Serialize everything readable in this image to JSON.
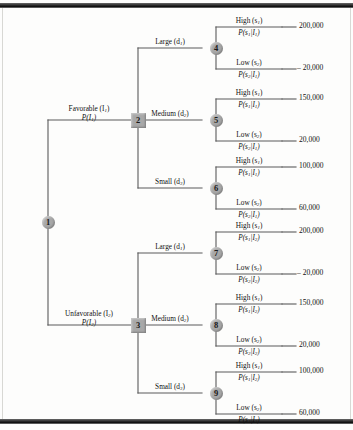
{
  "figure": {
    "type": "decision-tree",
    "node_shapes": {
      "chance": "circle",
      "decision": "square"
    },
    "node_fill": "#a8a8a8",
    "line_color": "#5a5a5a"
  },
  "nodes": [
    {
      "id": "1",
      "label": "1",
      "kind": "chance"
    },
    {
      "id": "2",
      "label": "2",
      "kind": "decision"
    },
    {
      "id": "3",
      "label": "3",
      "kind": "decision"
    },
    {
      "id": "4",
      "label": "4",
      "kind": "chance"
    },
    {
      "id": "5",
      "label": "5",
      "kind": "chance"
    },
    {
      "id": "6",
      "label": "6",
      "kind": "chance"
    },
    {
      "id": "7",
      "label": "7",
      "kind": "chance"
    },
    {
      "id": "8",
      "label": "8",
      "kind": "chance"
    },
    {
      "id": "9",
      "label": "9",
      "kind": "chance"
    }
  ],
  "information_branches": [
    {
      "name": "favorable",
      "label": "Favorable (I",
      "label_sub": "1",
      "label_tail": ")",
      "prob": "P(I",
      "prob_sub": "1",
      "prob_tail": ")"
    },
    {
      "name": "unfavorable",
      "label": "Unfavorable (I",
      "label_sub": "2",
      "label_tail": ")",
      "prob": "P(I",
      "prob_sub": "2",
      "prob_tail": ")"
    }
  ],
  "decisions": [
    {
      "name": "large",
      "label": "Large (d",
      "sub": "1",
      "tail": ")"
    },
    {
      "name": "medium",
      "label": "Medium (d",
      "sub": "2",
      "tail": ")"
    },
    {
      "name": "small",
      "label": "Small (d",
      "sub": "3",
      "tail": ")"
    }
  ],
  "states": [
    {
      "name": "high",
      "label": "High (s",
      "sub": "1",
      "tail": ")"
    },
    {
      "name": "low",
      "label": "Low (s",
      "sub": "2",
      "tail": ")"
    }
  ],
  "branches": {
    "n4": {
      "high": {
        "state": "High (s",
        "state_sub": "1",
        "state_tail": ")",
        "prob": "P(s",
        "prob_sub1": "1",
        "prob_mid": "|I",
        "prob_sub2": "1",
        "prob_tail": ")",
        "payoff": "200,000"
      },
      "low": {
        "state": "Low (s",
        "state_sub": "2",
        "state_tail": ")",
        "prob": "P(s",
        "prob_sub1": "2",
        "prob_mid": "|I",
        "prob_sub2": "1",
        "prob_tail": ")",
        "payoff": "– 20,000"
      }
    },
    "n5": {
      "high": {
        "state": "High (s",
        "state_sub": "1",
        "state_tail": ")",
        "prob": "P(s",
        "prob_sub1": "1",
        "prob_mid": "|I",
        "prob_sub2": "1",
        "prob_tail": ")",
        "payoff": "150,000"
      },
      "low": {
        "state": "Low (s",
        "state_sub": "2",
        "state_tail": ")",
        "prob": "P(s",
        "prob_sub1": "2",
        "prob_mid": "|I",
        "prob_sub2": "1",
        "prob_tail": ")",
        "payoff": "20,000"
      }
    },
    "n6": {
      "high": {
        "state": "High (s",
        "state_sub": "1",
        "state_tail": ")",
        "prob": "P(s",
        "prob_sub1": "1",
        "prob_mid": "|I",
        "prob_sub2": "1",
        "prob_tail": ")",
        "payoff": "100,000"
      },
      "low": {
        "state": "Low (s",
        "state_sub": "2",
        "state_tail": ")",
        "prob": "P(s",
        "prob_sub1": "2",
        "prob_mid": "|I",
        "prob_sub2": "1",
        "prob_tail": ")",
        "payoff": "60,000"
      }
    },
    "n7": {
      "high": {
        "state": "High (s",
        "state_sub": "1",
        "state_tail": ")",
        "prob": "P(s",
        "prob_sub1": "1",
        "prob_mid": "|I",
        "prob_sub2": "2",
        "prob_tail": ")",
        "payoff": "200,000"
      },
      "low": {
        "state": "Low (s",
        "state_sub": "2",
        "state_tail": ")",
        "prob": "P(s",
        "prob_sub1": "2",
        "prob_mid": "|I",
        "prob_sub2": "2",
        "prob_tail": ")",
        "payoff": "– 20,000"
      }
    },
    "n8": {
      "high": {
        "state": "High (s",
        "state_sub": "1",
        "state_tail": ")",
        "prob": "P(s",
        "prob_sub1": "1",
        "prob_mid": "|I",
        "prob_sub2": "2",
        "prob_tail": ")",
        "payoff": "150,000"
      },
      "low": {
        "state": "Low (s",
        "state_sub": "2",
        "state_tail": ")",
        "prob": "P(s",
        "prob_sub1": "2",
        "prob_mid": "|I",
        "prob_sub2": "2",
        "prob_tail": ")",
        "payoff": "20,000"
      }
    },
    "n9": {
      "high": {
        "state": "High (s",
        "state_sub": "1",
        "state_tail": ")",
        "prob": "P(s",
        "prob_sub1": "1",
        "prob_mid": "|I",
        "prob_sub2": "2",
        "prob_tail": ")",
        "payoff": "100,000"
      },
      "low": {
        "state": "Low (s",
        "state_sub": "2",
        "state_tail": ")",
        "prob": "P(s",
        "prob_sub1": "2",
        "prob_mid": "|I",
        "prob_sub2": "2",
        "prob_tail": ")",
        "payoff": "60,000"
      }
    }
  }
}
